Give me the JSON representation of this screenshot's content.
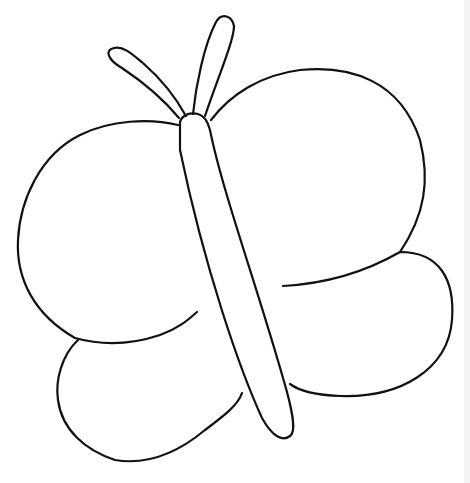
{
  "image": {
    "subject": "butterfly coloring page outline",
    "background_color": "#ffffff",
    "line_color": "#111111",
    "edge_strip_color": "#f3f3f3"
  },
  "parts": [
    "left-antenna",
    "right-antenna",
    "body",
    "left-upper-wing",
    "right-upper-wing",
    "left-lower-wing",
    "right-lower-wing"
  ]
}
